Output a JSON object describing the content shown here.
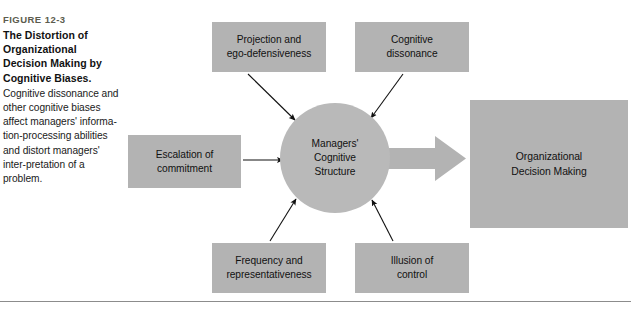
{
  "figure": {
    "number": "FIGURE 12-3",
    "title": "The Distortion of Organizational Decision Making by Cognitive Biases.",
    "description": "Cognitive dissonance and other cognitive biases affect managers' informa-tion-processing abilities and distort managers' inter-pretation of a problem."
  },
  "diagram": {
    "type": "influence-diagram",
    "center": {
      "id": "managers-cognitive-structure",
      "label": "Managers'\nCognitive\nStructure",
      "shape": "circle",
      "fill": "#b9b9b9"
    },
    "outcome": {
      "id": "organizational-decision-making",
      "label": "Organizational\nDecision Making",
      "shape": "rectangle",
      "fill": "#b3b3b3"
    },
    "arrow_to_outcome": {
      "id": "block-arrow",
      "direction": "right",
      "fill": "#b3b3b3"
    },
    "bias_nodes": [
      {
        "id": "projection-and-ego-defensiveness",
        "label": "Projection and\nego-defensiveness",
        "position": "top-left",
        "fill": "#b3b3b3"
      },
      {
        "id": "cognitive-dissonance",
        "label": "Cognitive\ndissonance",
        "position": "top-right",
        "fill": "#b3b3b3"
      },
      {
        "id": "escalation-of-commitment",
        "label": "Escalation of\ncommitment",
        "position": "left",
        "fill": "#b3b3b3"
      },
      {
        "id": "frequency-and-representativeness",
        "label": "Frequency and\nrepresentativeness",
        "position": "bottom-left",
        "fill": "#b3b3b3"
      },
      {
        "id": "illusion-of-control",
        "label": "Illusion of\ncontrol",
        "position": "bottom-right",
        "fill": "#b3b3b3"
      }
    ]
  },
  "colors": {
    "node_fill": "#b3b3b3",
    "circle_fill": "#b9b9b9",
    "rule": "#8c8c8c",
    "figure_number": "#5c5c4e",
    "text": "#111111",
    "background": "#ffffff"
  }
}
